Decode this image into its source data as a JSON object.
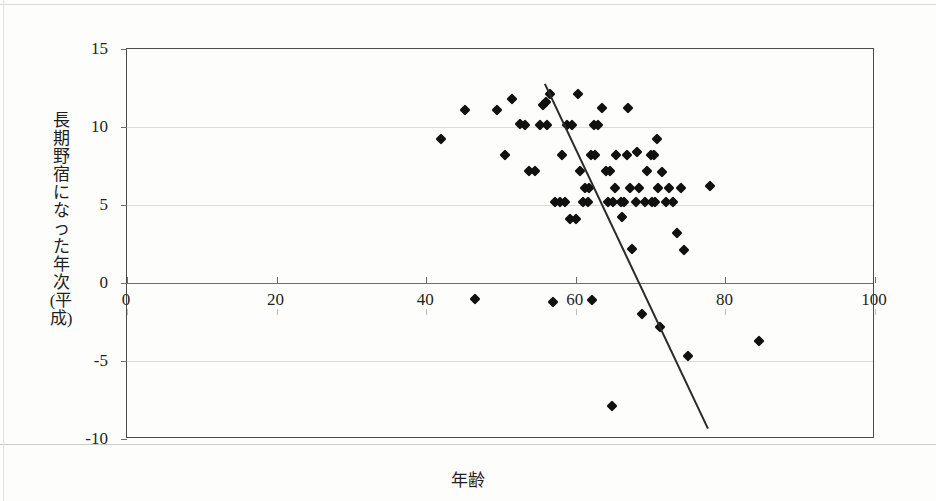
{
  "chart_data": {
    "type": "scatter",
    "title": "",
    "xlabel": "年齢",
    "ylabel": "長期野宿になった年次(平成)",
    "xlim": [
      0,
      100
    ],
    "ylim": [
      -10,
      15
    ],
    "xticks": [
      0,
      20,
      40,
      60,
      80,
      100
    ],
    "yticks": [
      15,
      10,
      5,
      0,
      -5,
      -10
    ],
    "xtick_labels": [
      "0",
      "20",
      "40",
      "60",
      "80",
      "100"
    ],
    "ytick_labels": [
      "15",
      "10",
      "5",
      "0",
      "-5",
      "-10"
    ],
    "grid": "horizontal",
    "legend": "none",
    "marker": "diamond",
    "marker_color": "#111111",
    "points": [
      [
        42.0,
        9.2
      ],
      [
        45.2,
        11.1
      ],
      [
        46.5,
        -1.0
      ],
      [
        49.5,
        11.1
      ],
      [
        51.5,
        11.8
      ],
      [
        50.5,
        8.2
      ],
      [
        52.5,
        10.2
      ],
      [
        53.2,
        10.1
      ],
      [
        53.8,
        7.2
      ],
      [
        54.5,
        7.2
      ],
      [
        55.6,
        11.4
      ],
      [
        56.0,
        11.6
      ],
      [
        55.2,
        10.1
      ],
      [
        56.2,
        10.1
      ],
      [
        56.5,
        12.1
      ],
      [
        57.0,
        -1.2
      ],
      [
        57.2,
        5.2
      ],
      [
        57.9,
        5.2
      ],
      [
        58.6,
        5.2
      ],
      [
        58.2,
        8.2
      ],
      [
        58.8,
        10.1
      ],
      [
        59.5,
        10.1
      ],
      [
        59.2,
        4.1
      ],
      [
        60.0,
        4.1
      ],
      [
        60.3,
        12.1
      ],
      [
        60.5,
        7.2
      ],
      [
        60.9,
        5.2
      ],
      [
        61.6,
        5.2
      ],
      [
        61.2,
        6.1
      ],
      [
        61.8,
        6.1
      ],
      [
        62.0,
        8.2
      ],
      [
        62.6,
        8.2
      ],
      [
        62.4,
        10.1
      ],
      [
        63.0,
        10.1
      ],
      [
        62.2,
        -1.1
      ],
      [
        63.5,
        11.2
      ],
      [
        64.0,
        7.2
      ],
      [
        64.6,
        7.2
      ],
      [
        64.3,
        5.2
      ],
      [
        65.0,
        5.2
      ],
      [
        65.2,
        6.1
      ],
      [
        65.4,
        8.2
      ],
      [
        64.8,
        -7.9
      ],
      [
        66.0,
        5.2
      ],
      [
        66.5,
        5.2
      ],
      [
        66.2,
        4.2
      ],
      [
        66.8,
        8.2
      ],
      [
        67.2,
        6.1
      ],
      [
        67.0,
        11.2
      ],
      [
        67.5,
        2.2
      ],
      [
        68.0,
        5.2
      ],
      [
        68.5,
        6.1
      ],
      [
        68.2,
        8.4
      ],
      [
        68.8,
        -2.0
      ],
      [
        69.5,
        7.2
      ],
      [
        69.2,
        5.2
      ],
      [
        70.0,
        8.2
      ],
      [
        70.4,
        8.2
      ],
      [
        70.8,
        9.2
      ],
      [
        70.2,
        5.2
      ],
      [
        70.6,
        5.2
      ],
      [
        71.0,
        6.1
      ],
      [
        71.5,
        7.1
      ],
      [
        71.2,
        -2.8
      ],
      [
        72.0,
        5.2
      ],
      [
        72.5,
        6.1
      ],
      [
        73.0,
        5.2
      ],
      [
        73.5,
        3.2
      ],
      [
        74.0,
        6.1
      ],
      [
        74.5,
        2.1
      ],
      [
        75.0,
        -4.7
      ],
      [
        78.0,
        6.2
      ],
      [
        84.5,
        -3.7
      ]
    ],
    "trend_line": {
      "type": "linear",
      "x_start": 56.0,
      "y_start": 12.7,
      "x_end": 77.8,
      "y_end": -9.4,
      "color": "#2a2a2a"
    }
  }
}
